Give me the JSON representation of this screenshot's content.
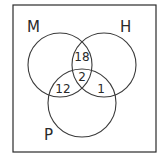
{
  "diagram": {
    "type": "venn-3",
    "sets": [
      {
        "id": "M",
        "label": "M"
      },
      {
        "id": "H",
        "label": "H"
      },
      {
        "id": "P",
        "label": "P"
      }
    ],
    "regions": {
      "M_and_H_only": "18",
      "M_and_H_and_P": "2",
      "M_and_P_only": "12",
      "H_and_P_only": "1"
    },
    "colors": {
      "stroke": "#3a3a3a",
      "text": "#2a2a2a",
      "background": "#ffffff"
    }
  }
}
